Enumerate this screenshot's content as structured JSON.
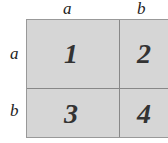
{
  "column_labels": [
    "a",
    "b"
  ],
  "row_labels": [
    "a",
    "b"
  ],
  "cells": [
    "1",
    "2",
    "3",
    "4"
  ]
}
